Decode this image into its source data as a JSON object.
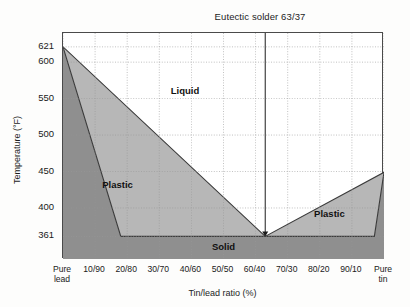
{
  "chart_data": {
    "type": "area",
    "title": "Eutectic solder 63/37",
    "xlabel": "Tin/lead ratio (%)",
    "ylabel": "Temperature (°F)",
    "grid": true,
    "legend_position": "none",
    "ylim": [
      330,
      640
    ],
    "xlim": [
      0,
      100
    ],
    "ytick_values": [
      621,
      600,
      550,
      500,
      450,
      400,
      361
    ],
    "ytick_labels": [
      "621",
      "600",
      "550",
      "500",
      "450",
      "400",
      "361"
    ],
    "xtick_values": [
      0,
      10,
      20,
      30,
      40,
      50,
      60,
      70,
      80,
      90,
      100
    ],
    "xtick_labels": [
      "Pure\nlead",
      "10/90",
      "20/80",
      "30/70",
      "40/60",
      "50/50",
      "60/40",
      "70/30",
      "80/20",
      "90/10",
      "Pure\ntin"
    ],
    "annotations": [
      {
        "text": "Liquid",
        "x": 38,
        "y": 560
      },
      {
        "text": "Plastic",
        "x": 17,
        "y": 432
      },
      {
        "text": "Plastic",
        "x": 83,
        "y": 392
      },
      {
        "text": "Solid",
        "x": 50,
        "y": 347
      }
    ],
    "eutectic": {
      "label": "Eutectic solder 63/37",
      "x": 63,
      "y": 361,
      "temperature_f": 361
    },
    "series": [
      {
        "name": "Liquidus",
        "x": [
          0,
          63,
          100
        ],
        "values": [
          621,
          361,
          449
        ]
      },
      {
        "name": "Solidus",
        "x": [
          0,
          18,
          63,
          97,
          100
        ],
        "values": [
          621,
          361,
          361,
          361,
          449
        ]
      }
    ],
    "regions": [
      {
        "name": "Liquid",
        "fill": "#ffffff"
      },
      {
        "name": "Plastic",
        "fill": "#b7b7b7"
      },
      {
        "name": "Solid",
        "fill": "#8f8f8f"
      }
    ],
    "colors": {
      "liquid_fill": "#ffffff",
      "plastic_fill": "#b7b7b7",
      "solid_fill": "#8f8f8f",
      "axis": "#4a4a4a",
      "grid": "#9a9a9a",
      "curve": "#3a3a3a",
      "text": "#1a1a1a"
    }
  }
}
